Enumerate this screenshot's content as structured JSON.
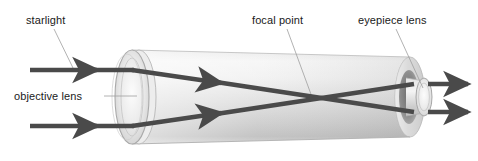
{
  "figure": {
    "type": "optical-ray-diagram",
    "background_color": "#ffffff",
    "width": 478,
    "height": 161
  },
  "labels": {
    "starlight": "starlight",
    "objective_lens": "objective lens",
    "focal_point": "focal point",
    "eyepiece_lens": "eyepiece lens"
  },
  "colors": {
    "label_text": "#1a1a1a",
    "ray": "#4a4a4a",
    "leader_line": "#9a9a9a",
    "tube_outline": "#b8b8b8",
    "tube_light": "#f2f2f2",
    "tube_mid": "#d9d9d9",
    "tube_dark": "#b0b0b0",
    "lens_glass": "#e6e6e6",
    "tube_interior": "#7c7c7c"
  },
  "components": [
    {
      "name": "objective-lens",
      "shape": "ellipse",
      "cx": 132,
      "cy": 97,
      "rx": 17,
      "ry": 47
    },
    {
      "name": "telescope-tube",
      "shape": "cylinder",
      "left_x": 132,
      "right_x": 410,
      "left_radius_y": 47,
      "right_radius_y": 40
    },
    {
      "name": "eyepiece-lens",
      "shape": "ellipse",
      "cx": 424,
      "cy": 97,
      "rx": 8,
      "ry": 19
    },
    {
      "name": "focal-point",
      "shape": "crossing-point",
      "x": 313,
      "y": 99
    }
  ],
  "rays": [
    {
      "name": "incoming-ray-upper",
      "from": [
        30,
        70
      ],
      "to": [
        132,
        70
      ],
      "arrowhead_at": [
        98,
        70
      ],
      "direction": "right"
    },
    {
      "name": "incoming-ray-lower",
      "from": [
        30,
        126
      ],
      "to": [
        132,
        126
      ],
      "arrowhead_at": [
        98,
        126
      ],
      "direction": "right"
    },
    {
      "name": "refracted-ray-upper",
      "from": [
        132,
        70
      ],
      "to": [
        413,
        112
      ],
      "arrowhead_at": [
        222,
        83
      ],
      "direction": "right-down"
    },
    {
      "name": "refracted-ray-lower",
      "from": [
        132,
        126
      ],
      "to": [
        413,
        84
      ],
      "arrowhead_at": [
        222,
        113
      ],
      "direction": "right-up"
    },
    {
      "name": "exit-ray-upper",
      "from": [
        424,
        84
      ],
      "to": [
        470,
        84
      ],
      "arrowhead_at": [
        470,
        84
      ],
      "direction": "right"
    },
    {
      "name": "exit-ray-lower",
      "from": [
        424,
        112
      ],
      "to": [
        470,
        112
      ],
      "arrowhead_at": [
        470,
        112
      ],
      "direction": "right"
    }
  ],
  "leaders": [
    {
      "name": "starlight-leader",
      "from": [
        54,
        28
      ],
      "to": [
        74,
        70
      ]
    },
    {
      "name": "objective-lens-leader",
      "from": [
        104,
        96
      ],
      "to": [
        137,
        96
      ]
    },
    {
      "name": "focal-point-leader",
      "from": [
        287,
        28
      ],
      "to": [
        312,
        98
      ]
    },
    {
      "name": "eyepiece-lens-leader",
      "from": [
        396,
        28
      ],
      "to": [
        424,
        88
      ]
    }
  ]
}
